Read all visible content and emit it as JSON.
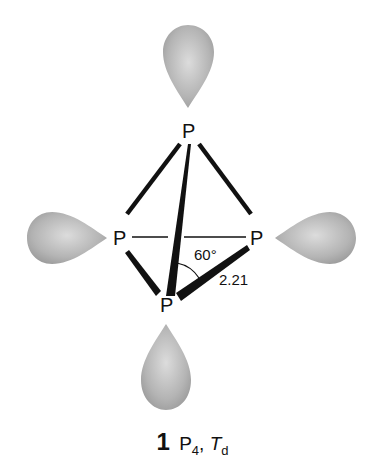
{
  "diagram": {
    "atoms": [
      {
        "id": "top",
        "label": "P"
      },
      {
        "id": "left",
        "label": "P"
      },
      {
        "id": "right",
        "label": "P"
      },
      {
        "id": "bottom",
        "label": "P"
      }
    ],
    "angle_label": "60°",
    "bond_length_label": "2.21",
    "caption": {
      "number": "1",
      "formula_main": "P",
      "formula_sub": "4",
      "separator": ",",
      "symmetry_main": "T",
      "symmetry_sub": "d"
    },
    "colors": {
      "bond": "#111111",
      "lobe_light": "#d8d8d8",
      "lobe_dark": "#9a9a9a"
    }
  }
}
